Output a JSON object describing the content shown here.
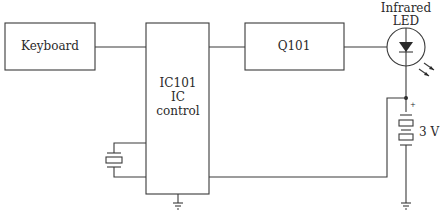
{
  "diagram": {
    "type": "block-diagram",
    "blocks": {
      "keyboard": {
        "label": "Keyboard"
      },
      "ic": {
        "lines": [
          "IC101",
          "IC",
          "control"
        ]
      },
      "q101": {
        "label": "Q101"
      },
      "led": {
        "lines": [
          "Infrared",
          "LED"
        ]
      },
      "battery": {
        "label": "3 V",
        "polarity": "+"
      }
    },
    "connections": [
      {
        "from": "Keyboard",
        "to": "IC101"
      },
      {
        "from": "IC101",
        "to": "Q101"
      },
      {
        "from": "Q101",
        "to": "Infrared LED"
      },
      {
        "from": "Infrared LED",
        "to": "3 V battery (+)"
      },
      {
        "from": "3 V battery (+)",
        "to": "IC101"
      },
      {
        "from": "Crystal",
        "to": "IC101"
      },
      {
        "from": "IC101",
        "to": "ground"
      },
      {
        "from": "3 V battery (-)",
        "to": "ground"
      }
    ],
    "colors": {
      "line": "#3a3a3a",
      "background": "#ffffff"
    }
  }
}
